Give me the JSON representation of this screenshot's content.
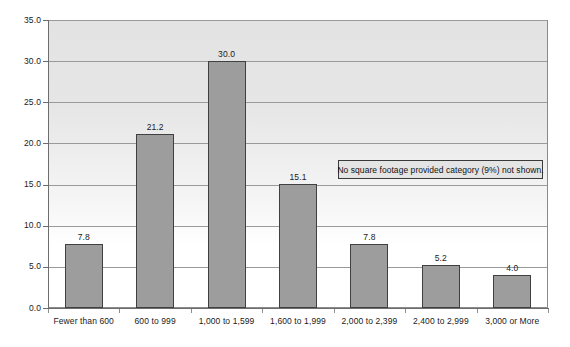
{
  "chart_data": {
    "type": "bar",
    "title": "",
    "subtitle": "",
    "xlabel": "",
    "ylabel": "",
    "ylim": [
      0,
      35
    ],
    "ytick_step": 5,
    "ytick_labels": [
      "0.0",
      "5.0",
      "10.0",
      "15.0",
      "20.0",
      "25.0",
      "30.0",
      "35.0"
    ],
    "ytick_values": [
      0,
      5,
      10,
      15,
      20,
      25,
      30,
      35
    ],
    "grid": true,
    "legend": false,
    "categories": [
      "Fewer than 600",
      "600 to 999",
      "1,000 to 1,599",
      "1,600 to 1,999",
      "2,000 to 2,399",
      "2,400 to 2,999",
      "3,000 or More"
    ],
    "values": [
      7.8,
      21.2,
      30.0,
      15.1,
      7.8,
      5.2,
      4.0
    ],
    "value_labels": [
      "7.8",
      "21.2",
      "30.0",
      "15.1",
      "7.8",
      "5.2",
      "4.0"
    ],
    "annotations": [
      "No square footage provided category (9%) not shown."
    ],
    "colors": {
      "bar_fill": "#9d9d9d",
      "bar_border": "#404040",
      "plot_background": "#e4e4e4",
      "gridline": "#9a9a9a",
      "axis": "#6d6d6d",
      "text": "#1a1a1a",
      "annotation_background": "#e4e4e4",
      "annotation_border": "#3a3a3a"
    }
  }
}
